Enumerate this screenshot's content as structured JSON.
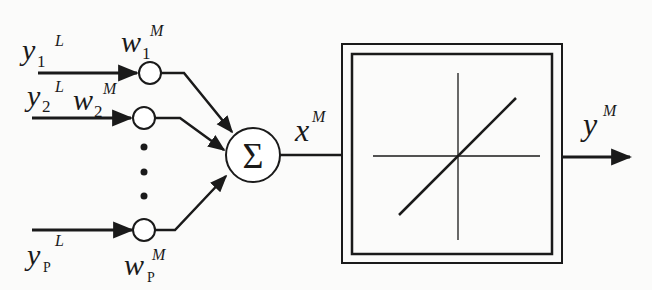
{
  "diagram": {
    "title": "",
    "type": "neuron-model-linear-activation",
    "colors": {
      "stroke": "#1a1a1a",
      "background": "#fbfbfa"
    },
    "inputs": [
      {
        "symbol": "y",
        "subscript": "1",
        "superscript": "L"
      },
      {
        "symbol": "y",
        "subscript": "2",
        "superscript": "L"
      },
      {
        "symbol": "y",
        "subscript": "P",
        "superscript": "L"
      }
    ],
    "weights": [
      {
        "symbol": "w",
        "subscript": "1",
        "superscript": "M"
      },
      {
        "symbol": "w",
        "subscript": "2",
        "superscript": "M"
      },
      {
        "symbol": "w",
        "subscript": "P",
        "superscript": "M"
      }
    ],
    "ellipsis": "⋮",
    "summation": {
      "symbol": "Σ"
    },
    "net_input": {
      "symbol": "x",
      "superscript": "M"
    },
    "activation": {
      "kind": "linear",
      "icon": "linear-transfer-function"
    },
    "output": {
      "symbol": "y",
      "superscript": "M"
    }
  }
}
